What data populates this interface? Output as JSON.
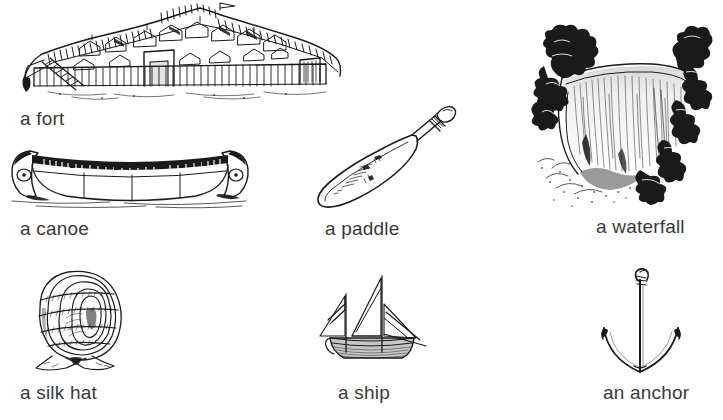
{
  "page": {
    "background_color": "#ffffff",
    "text_color": "#3a3a3a",
    "ink_color": "#1a1a1a",
    "width": 723,
    "height": 420,
    "columns": 3,
    "rows": 3
  },
  "items": [
    {
      "id": "fort",
      "label": "a fort",
      "icon": "fort-illustration",
      "row": 1,
      "column": 1,
      "label_x": 20,
      "label_y": 110
    },
    {
      "id": "canoe",
      "label": "a canoe",
      "icon": "canoe-illustration",
      "row": 2,
      "column": 1,
      "label_x": 20,
      "label_y": 220
    },
    {
      "id": "paddle",
      "label": "a paddle",
      "icon": "paddle-illustration",
      "row": 2,
      "column": 2,
      "label_x": 325,
      "label_y": 220
    },
    {
      "id": "waterfall",
      "label": "a waterfall",
      "icon": "waterfall-illustration",
      "row": 2,
      "column": 3,
      "label_x": 596,
      "label_y": 220
    },
    {
      "id": "silk-hat",
      "label": "a silk hat",
      "icon": "silk-hat-illustration",
      "row": 3,
      "column": 1,
      "label_x": 20,
      "label_y": 390
    },
    {
      "id": "ship",
      "label": "a ship",
      "icon": "ship-illustration",
      "row": 3,
      "column": 2,
      "label_x": 338,
      "label_y": 390
    },
    {
      "id": "anchor",
      "label": "an anchor",
      "icon": "anchor-illustration",
      "row": 3,
      "column": 3,
      "label_x": 603,
      "label_y": 390
    }
  ]
}
